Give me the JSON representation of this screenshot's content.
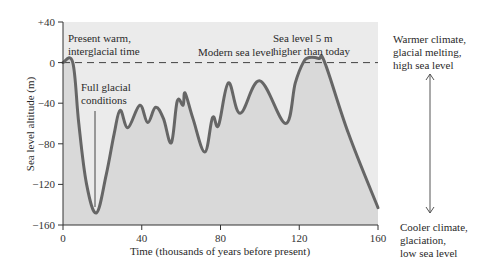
{
  "chart_data": {
    "type": "area",
    "title": "",
    "xlabel": "Time (thousands of years before present)",
    "ylabel": "Sea level altitude (m)",
    "xlim": [
      0,
      160
    ],
    "ylim": [
      -160,
      40
    ],
    "x_ticks": [
      "0",
      "40",
      "80",
      "120",
      "160"
    ],
    "y_ticks": [
      "+40",
      "0",
      "−40",
      "−80",
      "−120",
      "−160"
    ],
    "grid": false,
    "series": [
      {
        "name": "Sea level",
        "x": [
          0,
          5,
          8,
          12,
          17,
          22,
          26,
          29,
          33,
          39,
          43,
          47,
          51,
          55,
          58,
          61,
          62,
          66,
          72,
          76,
          79,
          84,
          90,
          100,
          113,
          118,
          122,
          125,
          130,
          133,
          145,
          160
        ],
        "y": [
          0,
          0,
          -60,
          -120,
          -148,
          -110,
          -70,
          -47,
          -64,
          -42,
          -59,
          -44,
          -55,
          -79,
          -38,
          -42,
          -30,
          -55,
          -88,
          -54,
          -62,
          -20,
          -50,
          -18,
          -60,
          -20,
          0,
          5,
          4,
          0,
          -70,
          -143
        ]
      }
    ],
    "reference_line": {
      "y": 0,
      "label": "Modern sea level",
      "style": "dashed"
    },
    "annotations": [
      {
        "text": [
          "Present warm,",
          "interglacial time"
        ],
        "x": 1,
        "y": 30
      },
      {
        "text": [
          "Full glacial",
          "conditions"
        ],
        "x": 9,
        "y": -10,
        "points_to": [
          17,
          -145
        ]
      },
      {
        "text": [
          "Sea level 5 m",
          "higher than today"
        ],
        "x": 107,
        "y": 30
      },
      {
        "text": [
          "Warmer climate,",
          "glacial melting,",
          "high sea level"
        ],
        "position": "right-top"
      },
      {
        "text": [
          "Cooler climate,",
          "glaciation,",
          "low sea level"
        ],
        "position": "right-bottom"
      }
    ],
    "legend": null
  },
  "labels": {
    "ylabel": "Sea level altitude (m)",
    "xlabel": "Time (thousands of years before present)",
    "modern": "Modern sea level",
    "present_1": "Present warm,",
    "present_2": "interglacial time",
    "glacial_1": "Full glacial",
    "glacial_2": "conditions",
    "high_1": "Sea level 5 m",
    "high_2": "higher than today",
    "warm_1": "Warmer climate,",
    "warm_2": "glacial melting,",
    "warm_3": "high sea level",
    "cool_1": "Cooler climate,",
    "cool_2": "glaciation,",
    "cool_3": "low sea level"
  },
  "colors": {
    "plot_bg": "#ebebeb",
    "area_fill": "#d9d9d9",
    "curve": "#666666",
    "axis": "#333333"
  }
}
